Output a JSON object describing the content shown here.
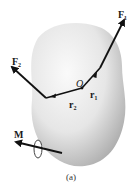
{
  "figure": {
    "caption": "(a)",
    "labels": {
      "F1": "F₁",
      "F2": "F₂",
      "r1": "r₁",
      "r2": "r₂",
      "O": "O",
      "M": "M"
    },
    "colors": {
      "body_light": "#f4f4f4",
      "body_dark": "#bdbdbd",
      "vector": "#111111"
    }
  }
}
